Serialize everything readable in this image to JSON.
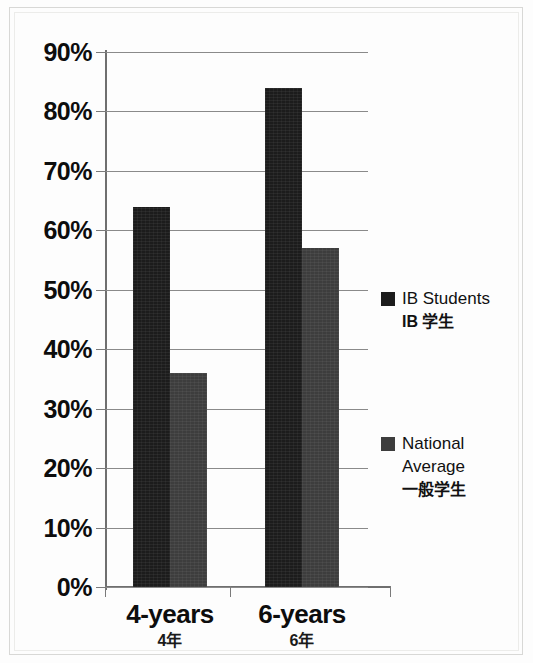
{
  "chart_data": {
    "type": "bar",
    "title": "",
    "subtitle": "",
    "xlabel": "",
    "ylabel": "",
    "categories": [
      "4-years",
      "6-years"
    ],
    "categories_secondary": [
      "4年",
      "6年"
    ],
    "ylim": [
      0,
      90
    ],
    "ytick_values": [
      0,
      10,
      20,
      30,
      40,
      50,
      60,
      70,
      80,
      90
    ],
    "ytick_labels": [
      "0%",
      "10%",
      "20%",
      "30%",
      "40%",
      "50%",
      "60%",
      "70%",
      "80%",
      "90%"
    ],
    "grid": true,
    "legend_position": "right",
    "series": [
      {
        "name": "IB Students",
        "name_secondary": "IB 学生",
        "color": "#1c1c1c",
        "values": [
          64,
          84
        ],
        "value_labels": [
          "64%",
          "84%"
        ]
      },
      {
        "name": "National Average",
        "name_secondary": "一般学生",
        "color": "#3d3d3d",
        "values": [
          36,
          57
        ],
        "value_labels": [
          "36%",
          "57%"
        ]
      }
    ]
  },
  "axis": {
    "y_ticks": [
      {
        "label": "90%",
        "value": 90
      },
      {
        "label": "80%",
        "value": 80
      },
      {
        "label": "70%",
        "value": 70
      },
      {
        "label": "60%",
        "value": 60
      },
      {
        "label": "50%",
        "value": 50
      },
      {
        "label": "40%",
        "value": 40
      },
      {
        "label": "30%",
        "value": 30
      },
      {
        "label": "20%",
        "value": 20
      },
      {
        "label": "10%",
        "value": 10
      },
      {
        "label": "0%",
        "value": 0
      }
    ]
  },
  "x_categories": [
    {
      "primary": "4-years",
      "secondary": "4年"
    },
    {
      "primary": "6-years",
      "secondary": "6年"
    }
  ],
  "legend": {
    "entries": [
      {
        "label": "IB Students",
        "label_secondary": "IB 学生",
        "color": "#1c1c1c"
      },
      {
        "label": "National Average",
        "label_secondary": "一般学生",
        "color": "#3d3d3d"
      }
    ]
  }
}
